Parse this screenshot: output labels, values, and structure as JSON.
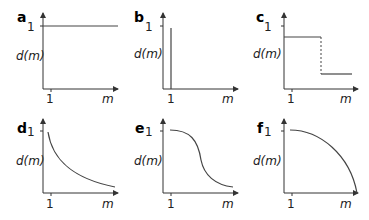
{
  "figure": {
    "panels": [
      {
        "letter": "a",
        "ylabel": "d(m)",
        "xlabel": "m",
        "ytick": "1",
        "xtick": "1",
        "shape": "constant"
      },
      {
        "letter": "b",
        "ylabel": "d(m)",
        "xlabel": "m",
        "ytick": "1",
        "xtick": "1",
        "shape": "spike-at-1"
      },
      {
        "letter": "c",
        "ylabel": "d(m)",
        "xlabel": "m",
        "ytick": "1",
        "xtick": "1",
        "shape": "step-down"
      },
      {
        "letter": "d",
        "ylabel": "d(m)",
        "xlabel": "m",
        "ytick": "1",
        "xtick": "1",
        "shape": "convex-decay"
      },
      {
        "letter": "e",
        "ylabel": "d(m)",
        "xlabel": "m",
        "ytick": "1",
        "xtick": "1",
        "shape": "sigmoid-decay"
      },
      {
        "letter": "f",
        "ylabel": "d(m)",
        "xlabel": "m",
        "ytick": "1",
        "xtick": "1",
        "shape": "concave-decay"
      }
    ]
  },
  "colors": {
    "axis": "#333333",
    "curve": "#444444",
    "background": "#ffffff"
  }
}
